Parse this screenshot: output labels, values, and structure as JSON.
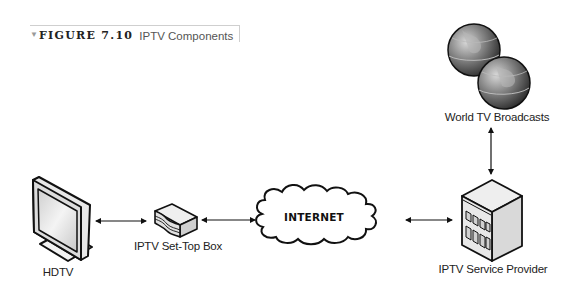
{
  "caption": {
    "marker": "▼",
    "figure_label": "FIGURE 7.10",
    "title": "IPTV Components"
  },
  "nodes": {
    "hdtv": {
      "label": "HDTV",
      "icon": "hdtv-monitor-icon"
    },
    "set_top_box": {
      "label": "IPTV Set-Top Box",
      "icon": "set-top-box-icon"
    },
    "internet": {
      "label": "INTERNET",
      "icon": "cloud-icon"
    },
    "service_provider": {
      "label": "IPTV Service Provider",
      "icon": "building-icon"
    },
    "world_tv": {
      "label": "World TV Broadcasts",
      "icon": "globes-icon"
    }
  },
  "connections": [
    {
      "from": "HDTV",
      "to": "IPTV Set-Top Box",
      "type": "bidirectional"
    },
    {
      "from": "IPTV Set-Top Box",
      "to": "INTERNET",
      "type": "bidirectional"
    },
    {
      "from": "INTERNET",
      "to": "IPTV Service Provider",
      "type": "bidirectional"
    },
    {
      "from": "IPTV Service Provider",
      "to": "World TV Broadcasts",
      "type": "bidirectional"
    }
  ]
}
